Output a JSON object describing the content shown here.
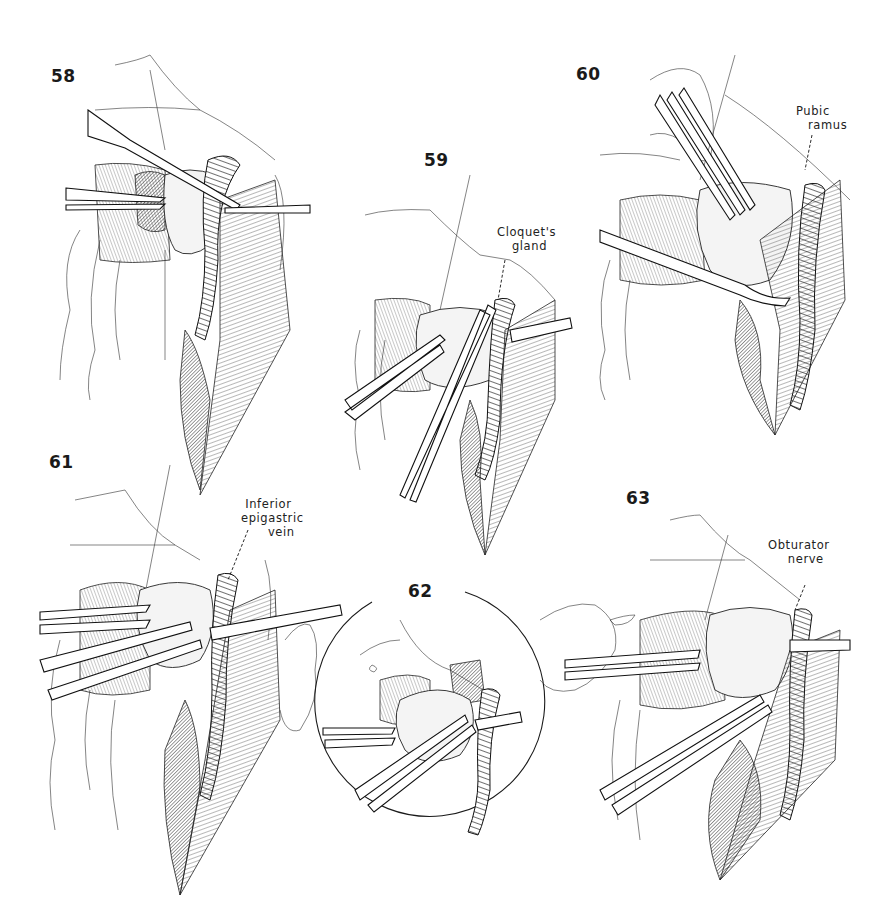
{
  "plate": {
    "type": "surgical illustration plate",
    "figures": [
      {
        "number": "58",
        "labels": []
      },
      {
        "number": "59",
        "labels": [
          {
            "lines": [
              "Cloquet's",
              "gland"
            ]
          }
        ]
      },
      {
        "number": "60",
        "labels": [
          {
            "lines": [
              "Pubic",
              "ramus"
            ]
          }
        ]
      },
      {
        "number": "61",
        "labels": [
          {
            "lines": [
              "Inferior",
              "epigastric",
              "vein"
            ]
          }
        ]
      },
      {
        "number": "62",
        "labels": [],
        "inset": "circular"
      },
      {
        "number": "63",
        "labels": [
          {
            "lines": [
              "Obturator",
              "nerve"
            ]
          }
        ]
      }
    ]
  },
  "colors": {
    "ink": "#1a1a1a",
    "background": "#ffffff"
  }
}
